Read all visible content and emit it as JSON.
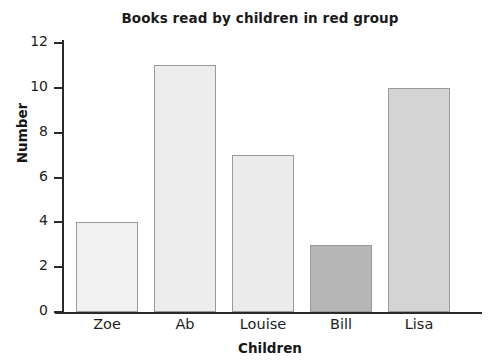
{
  "chart_data": {
    "type": "bar",
    "title": "Books read by children in red group",
    "xlabel": "Children",
    "ylabel": "Number",
    "categories": [
      "Zoe",
      "Ab",
      "Louise",
      "Bill",
      "Lisa"
    ],
    "values": [
      4,
      11,
      7,
      3,
      10
    ],
    "ylim": [
      0,
      12
    ],
    "yticks": [
      0,
      2,
      4,
      6,
      8,
      10,
      12
    ],
    "ytick_labels": [
      "0",
      "2",
      "4",
      "6",
      "8",
      "10",
      "12"
    ],
    "grid": false,
    "legend": null,
    "bar_colors": [
      "#f1f1f1",
      "#ededed",
      "#ebebeb",
      "#b6b6b6",
      "#d4d4d4"
    ],
    "bar_border_color": "#9a9a9a",
    "axis_color": "#2a2a2a",
    "background": "#ffffff"
  }
}
